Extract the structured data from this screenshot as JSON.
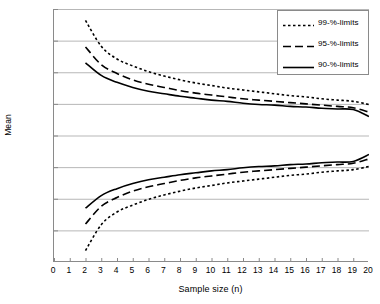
{
  "chart_data": {
    "type": "line",
    "title": "",
    "xlabel": "Sample size (n)",
    "ylabel": "Mean",
    "xlim": [
      0,
      20
    ],
    "ylim": [
      98.0,
      102.0
    ],
    "grid": true,
    "legend_position": "top-right",
    "xticks": [
      0,
      1,
      2,
      3,
      4,
      5,
      6,
      7,
      8,
      9,
      10,
      11,
      12,
      13,
      14,
      15,
      16,
      17,
      18,
      19,
      20
    ],
    "xtick_labels": [
      "0",
      "1",
      "2",
      "3",
      "4",
      "5",
      "6",
      "7",
      "8",
      "9",
      "10",
      "11",
      "12",
      "13",
      "14",
      "15",
      "16",
      "17",
      "18",
      "19",
      "20"
    ],
    "yticks": [
      98.0,
      98.5,
      99.0,
      99.5,
      100.0,
      100.5,
      101.0,
      101.5,
      102.0
    ],
    "ytick_labels": [
      "98.0",
      "98.5",
      "99.0",
      "99.5",
      "100.0",
      "100.5",
      "101.0",
      "101.5",
      "102.0"
    ],
    "x": [
      2,
      3,
      4,
      5,
      6,
      7,
      8,
      9,
      10,
      11,
      12,
      13,
      14,
      15,
      16,
      17,
      18,
      19,
      20
    ],
    "series": [
      {
        "name": "99-%-limits",
        "style": "dotted",
        "color": "#000000",
        "values": [
          101.82,
          101.41,
          101.21,
          101.1,
          101.01,
          100.94,
          100.88,
          100.83,
          100.79,
          100.75,
          100.72,
          100.69,
          100.66,
          100.63,
          100.61,
          100.58,
          100.56,
          100.54,
          100.49
        ]
      },
      {
        "name": "99-%-limits-lower",
        "style": "dotted",
        "color": "#000000",
        "values": [
          98.18,
          98.59,
          98.79,
          98.9,
          98.99,
          99.06,
          99.12,
          99.17,
          99.21,
          99.25,
          99.28,
          99.31,
          99.34,
          99.37,
          99.39,
          99.42,
          99.44,
          99.46,
          99.51
        ]
      },
      {
        "name": "95-%-limits",
        "style": "dashed",
        "color": "#000000",
        "values": [
          101.4,
          101.12,
          100.98,
          100.88,
          100.81,
          100.76,
          100.71,
          100.67,
          100.64,
          100.61,
          100.58,
          100.56,
          100.54,
          100.52,
          100.5,
          100.48,
          100.46,
          100.44,
          100.37
        ]
      },
      {
        "name": "95-%-limits-lower",
        "style": "dashed",
        "color": "#000000",
        "values": [
          98.6,
          98.88,
          99.02,
          99.12,
          99.19,
          99.24,
          99.29,
          99.33,
          99.36,
          99.39,
          99.42,
          99.44,
          99.46,
          99.48,
          99.5,
          99.52,
          99.54,
          99.56,
          99.63
        ]
      },
      {
        "name": "90-%-limits",
        "style": "solid",
        "color": "#000000",
        "values": [
          101.15,
          100.95,
          100.84,
          100.76,
          100.7,
          100.66,
          100.62,
          100.59,
          100.56,
          100.54,
          100.51,
          100.49,
          100.48,
          100.46,
          100.45,
          100.43,
          100.42,
          100.41,
          100.3
        ]
      },
      {
        "name": "90-%-limits-lower",
        "style": "solid",
        "color": "#000000",
        "values": [
          98.85,
          99.05,
          99.16,
          99.24,
          99.3,
          99.34,
          99.38,
          99.41,
          99.44,
          99.46,
          99.49,
          99.51,
          99.52,
          99.54,
          99.55,
          99.57,
          99.58,
          99.59,
          99.7
        ]
      }
    ],
    "legend_entries": [
      {
        "label": "99-%-limits",
        "style": "dotted"
      },
      {
        "label": "95-%-limits",
        "style": "dashed"
      },
      {
        "label": "90-%-limits",
        "style": "solid"
      }
    ]
  }
}
